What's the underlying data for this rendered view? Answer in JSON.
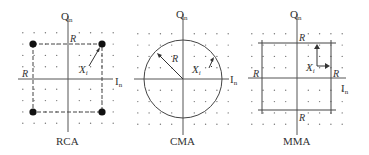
{
  "diagram": {
    "panels": [
      {
        "id": "rca",
        "caption": "RCA",
        "axis_q_label": "Q",
        "axis_i_label": "I",
        "subscript": "n",
        "origin": [
          68,
          78
        ],
        "grid_spacing": 11,
        "grid_cols": [
          22,
          33,
          44,
          55,
          79,
          90,
          102,
          113
        ],
        "grid_rows": [
          32,
          44,
          56,
          67,
          90,
          101,
          112,
          123
        ],
        "radius_label": "R",
        "vector_label": "X",
        "vector_sub": "i",
        "shape": "four-point-square"
      },
      {
        "id": "cma",
        "caption": "CMA",
        "axis_q_label": "Q",
        "axis_i_label": "I",
        "subscript": "n",
        "origin": [
          183,
          79
        ],
        "circle_radius": 39,
        "radius_label": "R",
        "vector_label": "X",
        "vector_sub": "i",
        "shape": "circle"
      },
      {
        "id": "mma",
        "caption": "MMA",
        "axis_q_label": "Q",
        "axis_i_label": "I",
        "subscript": "n",
        "origin": [
          297,
          79
        ],
        "rect": [
          262,
          43,
          331,
          110
        ],
        "radius_label": "R",
        "vector_label": "X",
        "vector_sub": "i",
        "shape": "square"
      }
    ],
    "colors": {
      "axis": "#555555",
      "dots": "#777777",
      "constellation_points": "#111111",
      "text": "#333333"
    }
  }
}
